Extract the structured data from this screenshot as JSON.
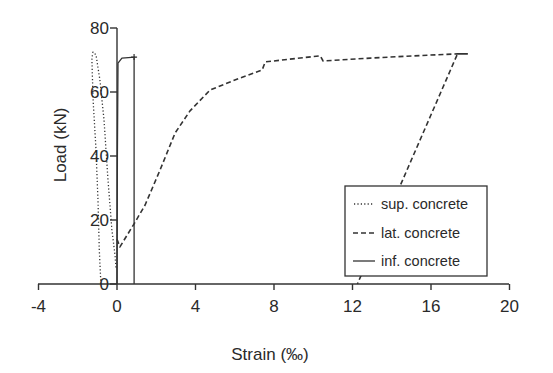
{
  "chart_data": {
    "type": "line",
    "title": "",
    "xlabel": "Strain (‰)",
    "ylabel": "Load (kN)",
    "xlim": [
      -4,
      20
    ],
    "ylim": [
      0,
      80
    ],
    "xticks": [
      -4,
      0,
      4,
      8,
      12,
      16,
      20
    ],
    "yticks": [
      0,
      20,
      40,
      60,
      80
    ],
    "xtick_labels": [
      "-4",
      "0",
      "4",
      "8",
      "12",
      "16",
      "20"
    ],
    "ytick_labels": [
      "0",
      "20",
      "40",
      "60",
      "80"
    ],
    "grid": false,
    "legend_position": "lower right",
    "series": [
      {
        "name": "sup. concrete",
        "style": "dotted",
        "x": [
          -0.82,
          -0.9,
          -0.97,
          -1.07,
          -1.22,
          -1.28,
          -1.25,
          -1.22,
          -1.07,
          -0.87,
          -0.66,
          -0.46,
          -0.26,
          -0.1,
          -0.05
        ],
        "y": [
          0,
          10.6,
          26,
          42,
          57.5,
          70,
          72,
          72.5,
          71.6,
          63.8,
          51.3,
          32.5,
          16.9,
          9,
          5
        ]
      },
      {
        "name": "lat. concrete",
        "style": "dashed",
        "x": [
          0.0,
          0.15,
          0.87,
          1.43,
          2.19,
          2.96,
          3.72,
          4.74,
          6.28,
          7.4,
          7.55,
          10.36,
          10.5,
          12.9,
          15.8,
          17.35,
          17.85,
          17.35,
          12.25
        ],
        "y": [
          14,
          11.6,
          18.8,
          24.7,
          35.6,
          47.2,
          54.1,
          60.6,
          64.4,
          66.9,
          69.4,
          71.3,
          69.7,
          70.6,
          71.5,
          71.9,
          71.9,
          71.9,
          0
        ]
      },
      {
        "name": "inf. concrete",
        "style": "solid",
        "x": [
          0.0,
          0.02,
          0.05,
          0.25,
          0.9,
          0.87,
          0.87
        ],
        "y": [
          0,
          40,
          69,
          70.6,
          70.9,
          70.9,
          0
        ]
      }
    ]
  },
  "legend": {
    "items": [
      {
        "label": "sup. concrete",
        "style": "dotted"
      },
      {
        "label": "lat. concrete",
        "style": "dashed"
      },
      {
        "label": "inf. concrete",
        "style": "solid"
      }
    ]
  },
  "colors": {
    "line": "#333333",
    "text": "#2a2a2a",
    "background": "#ffffff"
  }
}
